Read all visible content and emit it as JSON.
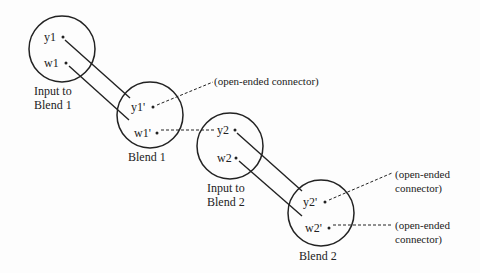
{
  "nodes": [
    {
      "id": "input1",
      "caption_line1": "Input to",
      "caption_line2": "Blend 1",
      "ports": [
        "y1",
        "w1"
      ]
    },
    {
      "id": "blend1",
      "caption": "Blend 1",
      "ports": [
        "y1'",
        "w1'"
      ]
    },
    {
      "id": "input2",
      "caption_line1": "Input to",
      "caption_line2": "Blend 2",
      "ports": [
        "y2",
        "w2"
      ]
    },
    {
      "id": "blend2",
      "caption": "Blend 2",
      "ports": [
        "y2'",
        "w2'"
      ]
    }
  ],
  "annotations": {
    "open1": "(open-ended connector)",
    "open2_line1": "(open-ended",
    "open2_line2": "connector)",
    "open3_line1": "(open-ended",
    "open3_line2": "connector)"
  },
  "colors": {
    "stroke": "#222222",
    "background": "#fdfdfd"
  }
}
